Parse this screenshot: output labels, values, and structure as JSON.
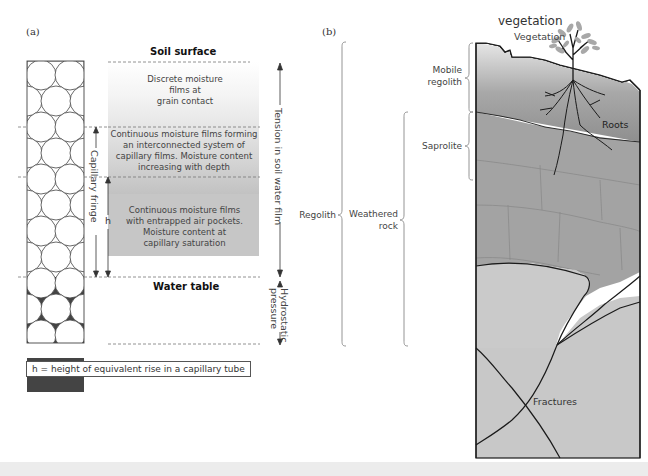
{
  "panel_a": {
    "tag": "(a)",
    "soil_surface": "Soil surface",
    "zone1": "Discrete moisture\nfilms at\ngrain contact",
    "zone2": "Continuous moisture films forming\nan interconnected system of\ncapillary films. Moisture content\nincreasing with depth",
    "zone3": "Continuous moisture films\nwith entrapped air pockets.\nMoisture content at\ncapillary saturation",
    "water_table": "Water table",
    "capillary_fringe": "Capillary fringe",
    "h_label": "h",
    "tension_label": "Tension in soil water film",
    "hydrostatic_label": "Hydrostatic\npressure",
    "legend": "h = height of equivalent rise in a capillary tube"
  },
  "panel_b": {
    "tag": "(b)",
    "vegetation_heading": "vegetation",
    "vegetation": "Vegetation",
    "mobile_regolith": "Mobile\nregolith",
    "roots": "Roots",
    "saprolite": "Saprolite",
    "regolith": "Regolith",
    "weathered_rock": "Weathered\nrock",
    "fractures": "Fractures"
  },
  "colors": {
    "soil_top": "#8a8a8a",
    "soil_mid": "#a9a9a9",
    "rock_light": "#c8c8c8",
    "water_zone": "#c4c4c4",
    "line": "#1a1a1a"
  }
}
